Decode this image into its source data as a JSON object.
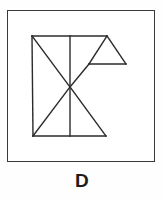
{
  "caption": {
    "label": "D"
  },
  "colors": {
    "frame_border": "#3a3a3a",
    "figure_stroke": "#2b2b2b",
    "background": "#ffffff",
    "caption_color": "#1c1c1c"
  },
  "figure": {
    "name": "tangram-outline-figure",
    "frame": {
      "x": 7,
      "y": 10,
      "width": 148,
      "height": 152
    },
    "stroke_width": 1.4,
    "vertices": {
      "top_left": [
        32,
        36
      ],
      "top_mid": [
        70,
        36
      ],
      "top_right": [
        107,
        36
      ],
      "bottom_left": [
        33,
        136
      ],
      "bottom_mid": [
        70,
        136
      ],
      "bottom_right": [
        106,
        136
      ],
      "center": [
        70,
        87
      ],
      "triangle_left": [
        89,
        64
      ],
      "triangle_right": [
        126,
        64
      ],
      "triangle_apex": [
        107,
        36
      ]
    },
    "segments": [
      {
        "name": "top-edge",
        "from": [
          32,
          36
        ],
        "to": [
          107,
          36
        ]
      },
      {
        "name": "left-edge",
        "from": [
          32,
          36
        ],
        "to": [
          33,
          136
        ]
      },
      {
        "name": "bottom-edge",
        "from": [
          33,
          136
        ],
        "to": [
          106,
          136
        ]
      },
      {
        "name": "vertical-midline",
        "from": [
          70,
          36
        ],
        "to": [
          70,
          136
        ]
      },
      {
        "name": "diagonal-top-left-to-center",
        "from": [
          32,
          36
        ],
        "to": [
          70,
          87
        ]
      },
      {
        "name": "diagonal-bottom-left-to-center",
        "from": [
          33,
          136
        ],
        "to": [
          70,
          87
        ]
      },
      {
        "name": "diagonal-center-to-bottom-right",
        "from": [
          70,
          87
        ],
        "to": [
          106,
          136
        ]
      },
      {
        "name": "diagonal-center-to-triangle-left",
        "from": [
          70,
          87
        ],
        "to": [
          89,
          64
        ]
      },
      {
        "name": "triangle-hypotenuse-left",
        "from": [
          89,
          64
        ],
        "to": [
          107,
          36
        ]
      },
      {
        "name": "triangle-hypotenuse-right",
        "from": [
          107,
          36
        ],
        "to": [
          126,
          64
        ]
      },
      {
        "name": "triangle-base",
        "from": [
          89,
          64
        ],
        "to": [
          126,
          64
        ]
      }
    ]
  }
}
